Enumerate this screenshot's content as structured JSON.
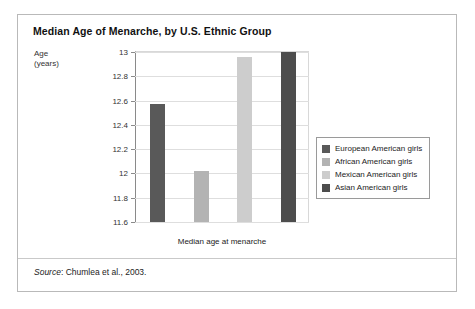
{
  "figure": {
    "title": "Median Age of Menarche, by U.S. Ethnic Group",
    "source_prefix": "Source",
    "source_text": ": Chumlea et al., 2003."
  },
  "chart_data": {
    "type": "bar",
    "title": "Median Age of Menarche, by U.S. Ethnic Group",
    "xlabel": "Median age at menarche",
    "ylabel": "Age (years)",
    "ylabel_line1": "Age",
    "ylabel_line2": "(years)",
    "categories": [
      "European American girls",
      "African American girls",
      "Mexican American girls",
      "Asian American girls"
    ],
    "values": [
      12.57,
      12.02,
      12.96,
      13.0
    ],
    "colors": [
      "#595959",
      "#b3b3b3",
      "#cdcdcd",
      "#4d4d4d"
    ],
    "ylim": [
      11.6,
      13.0
    ],
    "yticks": [
      "13",
      "12.8",
      "12.6",
      "12.4",
      "12.2",
      "12",
      "11.8",
      "11.6"
    ],
    "ytick_values": [
      13,
      12.8,
      12.6,
      12.4,
      12.2,
      12,
      11.8,
      11.6
    ],
    "grid": true,
    "legend_position": "right"
  },
  "legend": {
    "items": [
      {
        "label": "European American girls",
        "color": "#595959"
      },
      {
        "label": "African American girls",
        "color": "#b3b3b3"
      },
      {
        "label": "Mexican American girls",
        "color": "#cdcdcd"
      },
      {
        "label": "Asian American girls",
        "color": "#4d4d4d"
      }
    ]
  }
}
